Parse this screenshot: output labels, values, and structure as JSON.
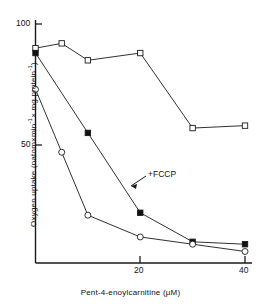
{
  "chart_data": {
    "type": "line",
    "title": "",
    "xlabel": "Pent-4-enoylcarnitine (µM)",
    "ylabel": "Oxygen uptake (natom×min⁻¹× mg protein⁻¹)",
    "xlim": [
      0,
      40
    ],
    "ylim": [
      0,
      100
    ],
    "xticks": [
      20,
      40
    ],
    "xticklabels": [
      "20",
      "40"
    ],
    "yticks": [
      50,
      100
    ],
    "yticklabels": [
      "50",
      "100"
    ],
    "grid": false,
    "legend": "none",
    "annotations": [
      {
        "text": "+FCCP",
        "x": 22.5,
        "y": 33,
        "points_to_series": "open-squares-uncoupled"
      }
    ],
    "series": [
      {
        "name": "open-squares",
        "marker": "open-square",
        "x": [
          0,
          5,
          10,
          20,
          30,
          40
        ],
        "values": [
          90,
          92,
          85,
          88,
          57,
          58
        ]
      },
      {
        "name": "open-squares-uncoupled",
        "marker": "filled-square",
        "x": [
          0,
          10,
          20,
          30,
          40
        ],
        "values": [
          88,
          55,
          22,
          10,
          9
        ]
      },
      {
        "name": "open-circles",
        "marker": "open-circle",
        "x": [
          0,
          5,
          10,
          20,
          30,
          40
        ],
        "values": [
          73,
          47,
          21,
          12,
          9,
          6
        ]
      }
    ]
  },
  "labels": {
    "xaxis": "Pent-4-enoylcarnitine (µM)",
    "yaxis_parts": {
      "p1": "Oxygen uptake (natom×min",
      "sup1": "-1",
      "p2": "× mg protein",
      "sup2": "-1",
      "p3": ")"
    },
    "ytick_100": "100",
    "ytick_50": "50",
    "xtick_20": "20",
    "xtick_40": "40",
    "fccp": "+FCCP"
  },
  "colors": {
    "line": "#1a1a1a",
    "marker_fill_open": "#ffffff",
    "marker_fill_solid": "#111111",
    "axis": "#1a1a1a",
    "background": "#ffffff"
  }
}
